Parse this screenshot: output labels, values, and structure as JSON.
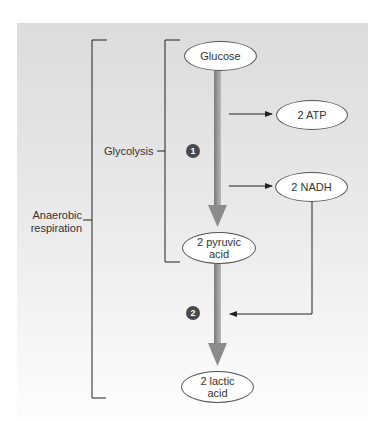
{
  "diagram": {
    "type": "flowchart",
    "brackets": {
      "outer": {
        "label": "Anaerobic respiration"
      },
      "inner": {
        "label": "Glycolysis"
      }
    },
    "nodes": {
      "glucose": {
        "label": "Glucose"
      },
      "atp": {
        "label": "2 ATP"
      },
      "nadh": {
        "label": "2 NADH"
      },
      "pyruvic": {
        "line1": "2 pyruvic",
        "line2": "acid"
      },
      "lactic": {
        "line1": "2 lactic",
        "line2": "acid"
      }
    },
    "steps": [
      {
        "number": "1"
      },
      {
        "number": "2"
      }
    ],
    "edges": [
      {
        "from": "Glucose",
        "to": "2 pyruvic acid",
        "style": "thick-gray-arrow"
      },
      {
        "from": "glycolysis",
        "to": "2 ATP",
        "style": "thin-arrow"
      },
      {
        "from": "glycolysis",
        "to": "2 NADH",
        "style": "thin-arrow"
      },
      {
        "from": "2 pyruvic acid",
        "to": "2 lactic acid",
        "style": "thick-gray-arrow"
      },
      {
        "from": "2 NADH",
        "to": "step 2",
        "style": "thin-elbow-arrow"
      }
    ],
    "colors": {
      "panel_top": "#dcdcdc",
      "panel_bottom": "#fdfdfd",
      "main_arrow": "#8c8c8c",
      "lines": "#222222",
      "step_badge": "#4a4a4a"
    }
  }
}
